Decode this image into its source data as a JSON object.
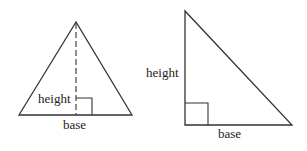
{
  "diagrams": [
    {
      "name": "isosceles-triangle",
      "labels": {
        "height": "height",
        "base": "base"
      },
      "height_style": "dashed"
    },
    {
      "name": "right-triangle",
      "labels": {
        "height": "height",
        "base": "base"
      }
    }
  ],
  "colors": {
    "stroke": "#333333",
    "text": "#222222",
    "background": "#ffffff"
  }
}
